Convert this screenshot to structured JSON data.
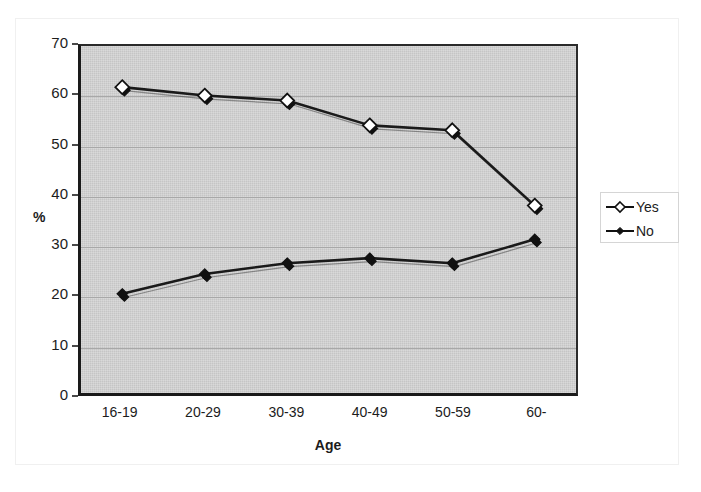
{
  "chart_data": {
    "type": "line",
    "title": "",
    "subtitle": "",
    "xlabel": "Age",
    "ylabel": "%",
    "categories": [
      "16-19",
      "20-29",
      "30-39",
      "40-49",
      "50-59",
      "60-"
    ],
    "ylim": [
      0,
      70
    ],
    "ytick_labels": [
      "70",
      "60",
      "50",
      "40",
      "30",
      "20",
      "10",
      "0"
    ],
    "ytick_values": [
      70,
      60,
      50,
      40,
      30,
      20,
      10,
      0
    ],
    "grid": "horizontal",
    "legend_position": "right",
    "plot_background": "#c9c9c9",
    "series": [
      {
        "name": "Yes",
        "marker": "diamond-open",
        "color": "#1a1a1a",
        "values": [
          61.7,
          60.0,
          59.0,
          54.0,
          53.0,
          37.8
        ]
      },
      {
        "name": "No",
        "marker": "diamond-filled",
        "color": "#1a1a1a",
        "values": [
          20.0,
          24.0,
          26.2,
          27.2,
          26.2,
          31.0
        ]
      }
    ]
  },
  "legend": {
    "items": [
      {
        "label": "Yes",
        "marker": "diamond-open-icon"
      },
      {
        "label": "No",
        "marker": "diamond-filled-icon"
      }
    ]
  }
}
